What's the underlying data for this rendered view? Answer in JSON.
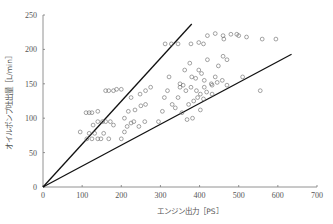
{
  "chart_data": {
    "type": "scatter",
    "title": "",
    "xlabel": "エンジン出力［PS］",
    "ylabel": "オイルポンプ吐出量［L/min］",
    "xlim": [
      0,
      700
    ],
    "ylim": [
      0,
      250
    ],
    "xticks": [
      0,
      100,
      200,
      300,
      400,
      500,
      600,
      700
    ],
    "yticks": [
      0,
      50,
      100,
      150,
      200,
      250
    ],
    "grid": false,
    "legend": "none",
    "reference_lines": [
      {
        "name": "upper-bound-line",
        "x": [
          0,
          380
        ],
        "y": [
          0,
          237
        ]
      },
      {
        "name": "lower-bound-line",
        "x": [
          0,
          635
        ],
        "y": [
          0,
          193
        ]
      }
    ],
    "series": [
      {
        "name": "data",
        "marker": "open-circle",
        "points": [
          [
            95,
            80
          ],
          [
            110,
            108
          ],
          [
            118,
            108
          ],
          [
            125,
            108
          ],
          [
            140,
            110
          ],
          [
            112,
            70
          ],
          [
            118,
            78
          ],
          [
            125,
            70
          ],
          [
            132,
            78
          ],
          [
            140,
            70
          ],
          [
            148,
            70
          ],
          [
            155,
            78
          ],
          [
            168,
            70
          ],
          [
            128,
            90
          ],
          [
            140,
            95
          ],
          [
            152,
            95
          ],
          [
            160,
            95
          ],
          [
            172,
            95
          ],
          [
            180,
            90
          ],
          [
            160,
            140
          ],
          [
            168,
            140
          ],
          [
            180,
            140
          ],
          [
            188,
            142
          ],
          [
            200,
            142
          ],
          [
            200,
            70
          ],
          [
            208,
            80
          ],
          [
            215,
            88
          ],
          [
            225,
            93
          ],
          [
            232,
            95
          ],
          [
            245,
            88
          ],
          [
            260,
            95
          ],
          [
            208,
            100
          ],
          [
            218,
            110
          ],
          [
            235,
            112
          ],
          [
            250,
            118
          ],
          [
            262,
            120
          ],
          [
            225,
            130
          ],
          [
            248,
            135
          ],
          [
            262,
            140
          ],
          [
            275,
            145
          ],
          [
            312,
            208
          ],
          [
            328,
            208
          ],
          [
            345,
            208
          ],
          [
            295,
            95
          ],
          [
            305,
            110
          ],
          [
            310,
            130
          ],
          [
            318,
            140
          ],
          [
            322,
            160
          ],
          [
            330,
            120
          ],
          [
            345,
            130
          ],
          [
            350,
            145
          ],
          [
            358,
            148
          ],
          [
            362,
            170
          ],
          [
            375,
            180
          ],
          [
            380,
            160
          ],
          [
            390,
            158
          ],
          [
            398,
            170
          ],
          [
            405,
            165
          ],
          [
            412,
            155
          ],
          [
            420,
            185
          ],
          [
            432,
            148
          ],
          [
            440,
            160
          ],
          [
            448,
            176
          ],
          [
            460,
            190
          ],
          [
            350,
            150
          ],
          [
            365,
            140
          ],
          [
            378,
            145
          ],
          [
            392,
            140
          ],
          [
            402,
            135
          ],
          [
            418,
            138
          ],
          [
            372,
            120
          ],
          [
            385,
            125
          ],
          [
            395,
            130
          ],
          [
            410,
            128
          ],
          [
            432,
            135
          ],
          [
            338,
            115
          ],
          [
            355,
            108
          ],
          [
            368,
            98
          ],
          [
            382,
            100
          ],
          [
            402,
            112
          ],
          [
            378,
            208
          ],
          [
            398,
            210
          ],
          [
            410,
            208
          ],
          [
            420,
            220
          ],
          [
            440,
            223
          ],
          [
            460,
            220
          ],
          [
            462,
            215
          ],
          [
            480,
            222
          ],
          [
            495,
            222
          ],
          [
            500,
            220
          ],
          [
            520,
            218
          ],
          [
            560,
            215
          ],
          [
            412,
            145
          ],
          [
            430,
            150
          ],
          [
            445,
            152
          ],
          [
            458,
            155
          ],
          [
            470,
            148
          ],
          [
            470,
            185
          ],
          [
            510,
            160
          ],
          [
            555,
            140
          ],
          [
            595,
            215
          ]
        ]
      }
    ]
  }
}
